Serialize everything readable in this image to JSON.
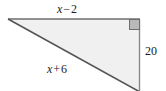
{
  "figure": {
    "kind": "right-triangle-diagram",
    "background_color": "#ffffff",
    "fill_color": "#f0f0f0",
    "stroke_color": "#6e6e6e",
    "hypotenuse_color": "#555555",
    "right_angle_marker_fill": "#b9b9b9",
    "right_angle_marker_stroke": "#6e6e6e",
    "labels": {
      "top_side": {
        "full": "x − 2",
        "variable": "x",
        "operator": "−",
        "number": "2"
      },
      "hypotenuse": {
        "full": "x + 6",
        "variable": "x",
        "operator": "+",
        "number": "6"
      },
      "right_side": {
        "full": "20",
        "value": "20"
      }
    },
    "geometry": {
      "apex_left": [
        8,
        19
      ],
      "corner_top_right": [
        140,
        19
      ],
      "vertex_bottom_right": [
        140,
        92
      ],
      "right_angle_at": "top-right"
    }
  }
}
